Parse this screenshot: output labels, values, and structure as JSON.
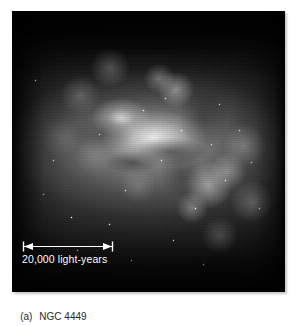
{
  "figure": {
    "caption_label": "(a)",
    "caption_name": "NGC 4449",
    "caption_full": "(a)  NGC 4449",
    "background_color": "#ffffff",
    "caption_color": "#2a2a2a"
  },
  "photo": {
    "subject": "NGC 4449",
    "subject_type": "irregular dwarf galaxy",
    "alt_text": "Black-and-white astronomical photograph of the irregular dwarf galaxy NGC 4449, showing a bright diffuse core elongated from upper-left to lower-right with numerous bright star-forming knots and a dark sky background.",
    "background_color": "#050505",
    "highlight_color": "#f4f4f4"
  },
  "scale_bar": {
    "label": "20,000 light-years",
    "length_value": "20,000",
    "unit": "light-years",
    "color": "#ffffff",
    "style": "double-headed-arrow-with-end-caps"
  }
}
